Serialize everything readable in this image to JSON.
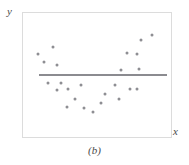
{
  "figure": {
    "caption": "(b)",
    "axis": {
      "x_label": "x",
      "y_label": "y"
    },
    "colors": {
      "point": "#8e8e93",
      "line": "#8b8b90",
      "frame": "#dcdcdc",
      "text": "#4a4a4a",
      "background": "#ffffff"
    }
  },
  "chart_data": {
    "type": "scatter",
    "title": "",
    "subtitle": "",
    "xlabel": "x",
    "ylabel": "y",
    "annotations": [
      "(b)"
    ],
    "grid": false,
    "legend": null,
    "xlim": [
      0,
      100
    ],
    "ylim": [
      0,
      100
    ],
    "axis_ticks": {
      "x": [],
      "y": []
    },
    "series": [
      {
        "name": "observations",
        "marker": "filled-circle",
        "color": "#8e8e93",
        "n": 24,
        "points": [
          {
            "x": 10.0,
            "y": 66.7
          },
          {
            "x": 14.0,
            "y": 60.3
          },
          {
            "x": 20.0,
            "y": 72.2
          },
          {
            "x": 23.3,
            "y": 57.9
          },
          {
            "x": 16.7,
            "y": 43.7
          },
          {
            "x": 26.0,
            "y": 43.7
          },
          {
            "x": 22.7,
            "y": 38.1
          },
          {
            "x": 30.7,
            "y": 38.9
          },
          {
            "x": 39.3,
            "y": 42.1
          },
          {
            "x": 35.3,
            "y": 31.0
          },
          {
            "x": 30.0,
            "y": 23.8
          },
          {
            "x": 41.3,
            "y": 23.0
          },
          {
            "x": 47.3,
            "y": 19.8
          },
          {
            "x": 52.7,
            "y": 27.8
          },
          {
            "x": 55.3,
            "y": 34.9
          },
          {
            "x": 62.0,
            "y": 42.1
          },
          {
            "x": 64.7,
            "y": 31.0
          },
          {
            "x": 72.0,
            "y": 38.9
          },
          {
            "x": 76.7,
            "y": 38.9
          },
          {
            "x": 66.0,
            "y": 54.0
          },
          {
            "x": 78.7,
            "y": 54.8
          },
          {
            "x": 70.0,
            "y": 67.5
          },
          {
            "x": 76.7,
            "y": 66.7
          },
          {
            "x": 80.0,
            "y": 78.6
          },
          {
            "x": 87.3,
            "y": 82.5
          }
        ]
      }
    ],
    "fit_line": {
      "name": "fitted regression line",
      "type": "horizontal",
      "color": "#8b8b90",
      "y": 50.8,
      "x_start": 10.7,
      "x_end": 97.3
    }
  }
}
